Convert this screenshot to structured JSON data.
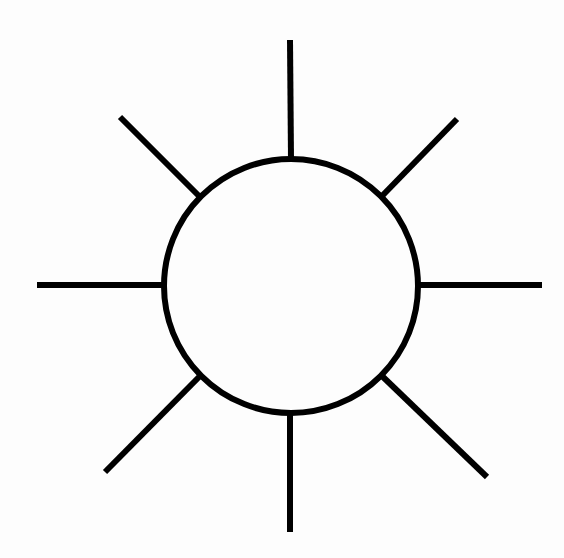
{
  "document": {
    "title": "Sun Symbol Line Drawing",
    "canvas_width": 564,
    "canvas_height": 558,
    "background_color": "#fdfdfd",
    "ink_color": "#000000",
    "style": "monochrome line art",
    "subject": "sun"
  },
  "figure": {
    "name": "sun-symbol",
    "stroke_color": "#000000",
    "stroke_width": 6,
    "fill_color": "#fdfdfd",
    "ray_count": 8
  },
  "disc": {
    "label": "sun-disc",
    "center_x": 291,
    "center_y": 286,
    "radius": 127,
    "stroke_width": 6
  },
  "rays": [
    {
      "label": "ray-north",
      "direction": "N",
      "angle_deg": 90,
      "x1": 290,
      "y1": 40,
      "x2": 291,
      "y2": 159
    },
    {
      "label": "ray-northeast",
      "direction": "NE",
      "angle_deg": 45,
      "x1": 457,
      "y1": 119,
      "x2": 382,
      "y2": 196
    },
    {
      "label": "ray-east",
      "direction": "E",
      "angle_deg": 0,
      "x1": 542,
      "y1": 285,
      "x2": 418,
      "y2": 285
    },
    {
      "label": "ray-southeast",
      "direction": "SE",
      "angle_deg": -45,
      "x1": 487,
      "y1": 477,
      "x2": 382,
      "y2": 376
    },
    {
      "label": "ray-south",
      "direction": "S",
      "angle_deg": -90,
      "x1": 290,
      "y1": 532,
      "x2": 290,
      "y2": 413
    },
    {
      "label": "ray-southwest",
      "direction": "SW",
      "angle_deg": -135,
      "x1": 105,
      "y1": 472,
      "x2": 199,
      "y2": 377
    },
    {
      "label": "ray-west",
      "direction": "W",
      "angle_deg": 180,
      "x1": 37,
      "y1": 285,
      "x2": 164,
      "y2": 285
    },
    {
      "label": "ray-northwest",
      "direction": "NW",
      "angle_deg": 135,
      "x1": 120,
      "y1": 117,
      "x2": 199,
      "y2": 196
    }
  ]
}
